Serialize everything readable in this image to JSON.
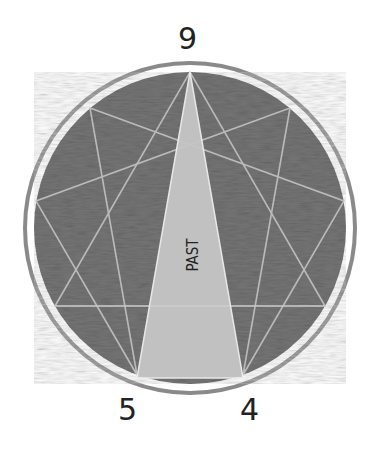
{
  "diagram": {
    "type": "enneagram",
    "points_labeled": [
      {
        "label": "9",
        "position": "top"
      },
      {
        "label": "5",
        "position": "bottom-left"
      },
      {
        "label": "4",
        "position": "bottom-right"
      }
    ],
    "highlighted_region": {
      "label": "PAST",
      "vertices": [
        "9",
        "5",
        "4"
      ]
    },
    "colors": {
      "background": "#ffffff",
      "circle_fill": "#6e6e6e",
      "ring": "#8a8a8a",
      "highlight_fill": "#c4c4c4",
      "lines": "#bdbdbd",
      "text": "#222222"
    }
  },
  "labels": {
    "top": "9",
    "bottom_left": "5",
    "bottom_right": "4",
    "center": "PAST"
  }
}
